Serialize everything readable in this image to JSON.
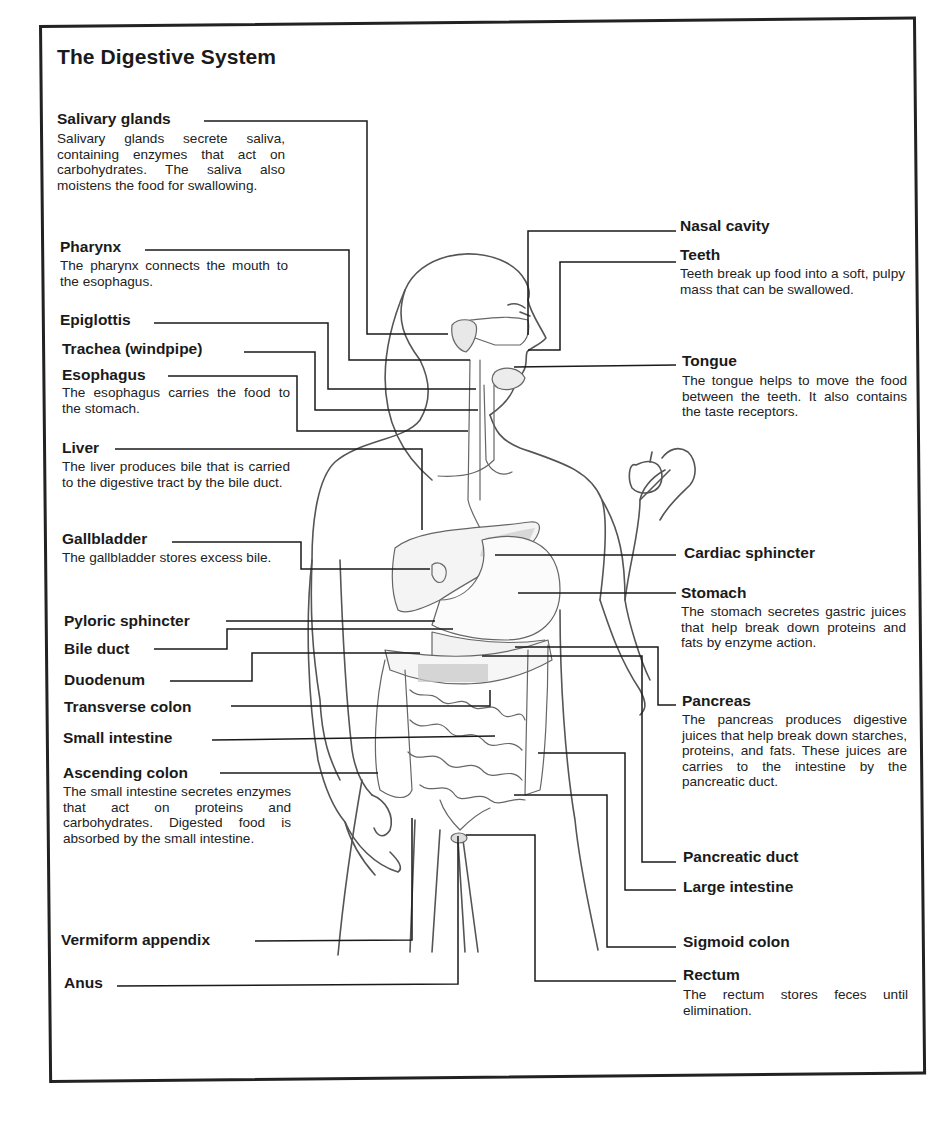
{
  "title": "The Digestive System",
  "colors": {
    "ink": "#1a1a1a",
    "frame": "#222222",
    "figure_line": "#555555",
    "shading": "#aaaaaa",
    "background": "#ffffff"
  },
  "labels_left": [
    {
      "id": "salivary-glands",
      "name": "Salivary glands",
      "description": "Salivary glands secrete saliva, containing enzymes that act on carbohydrates. The saliva also moistens the food for swallowing."
    },
    {
      "id": "pharynx",
      "name": "Pharynx",
      "description": "The pharynx connects the mouth to the esophagus."
    },
    {
      "id": "epiglottis",
      "name": "Epiglottis",
      "description": ""
    },
    {
      "id": "trachea",
      "name": "Trachea (windpipe)",
      "description": ""
    },
    {
      "id": "esophagus",
      "name": "Esophagus",
      "description": "The esophagus carries the food to the stomach."
    },
    {
      "id": "liver",
      "name": "Liver",
      "description": "The liver produces bile that is carried to the digestive tract by the bile duct."
    },
    {
      "id": "gallbladder",
      "name": "Gallbladder",
      "description": "The gallbladder stores excess bile."
    },
    {
      "id": "pyloric-sphincter",
      "name": "Pyloric sphincter",
      "description": ""
    },
    {
      "id": "bile-duct",
      "name": "Bile duct",
      "description": ""
    },
    {
      "id": "duodenum",
      "name": "Duodenum",
      "description": ""
    },
    {
      "id": "transverse-colon",
      "name": "Transverse colon",
      "description": ""
    },
    {
      "id": "small-intestine",
      "name": "Small intestine",
      "description": ""
    },
    {
      "id": "ascending-colon",
      "name": "Ascending colon",
      "description": "The small intestine secretes enzymes that act on proteins and carbohydrates. Digested food is absorbed by the small intestine."
    },
    {
      "id": "vermiform-appendix",
      "name": "Vermiform appendix",
      "description": ""
    },
    {
      "id": "anus",
      "name": "Anus",
      "description": ""
    }
  ],
  "labels_right": [
    {
      "id": "nasal-cavity",
      "name": "Nasal cavity",
      "description": ""
    },
    {
      "id": "teeth",
      "name": "Teeth",
      "description": "Teeth break up food into a soft, pulpy mass that can be swallowed."
    },
    {
      "id": "tongue",
      "name": "Tongue",
      "description": "The tongue helps to move the food between the teeth. It also contains the taste receptors."
    },
    {
      "id": "cardiac-sphincter",
      "name": "Cardiac sphincter",
      "description": ""
    },
    {
      "id": "stomach",
      "name": "Stomach",
      "description": "The stomach secretes gastric juices that help break down proteins and fats by enzyme action."
    },
    {
      "id": "pancreas",
      "name": "Pancreas",
      "description": "The pancreas produces digestive juices that help break down starches, proteins, and fats. These juices are carries to the intestine by the pancreatic duct."
    },
    {
      "id": "pancreatic-duct",
      "name": "Pancreatic duct",
      "description": ""
    },
    {
      "id": "large-intestine",
      "name": "Large intestine",
      "description": ""
    },
    {
      "id": "sigmoid-colon",
      "name": "Sigmoid colon",
      "description": ""
    },
    {
      "id": "rectum",
      "name": "Rectum",
      "description": "The rectum stores feces until elimination."
    }
  ]
}
